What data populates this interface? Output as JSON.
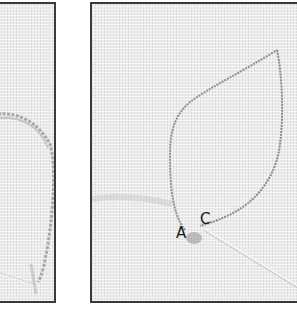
{
  "figure": {
    "panels": [
      {
        "id": "left",
        "content": "partial view of stitched loop with needle"
      },
      {
        "id": "right",
        "content": "leaf outline drawn on fabric with needle emerging",
        "labels": [
          "A",
          "C"
        ]
      }
    ]
  },
  "labels": {
    "a": "A",
    "c": "C"
  },
  "colors": {
    "fabric": "#ececec",
    "frame": "#3a3a3a",
    "outline": "#8a8a8a",
    "needle": "#d8d8d8"
  }
}
